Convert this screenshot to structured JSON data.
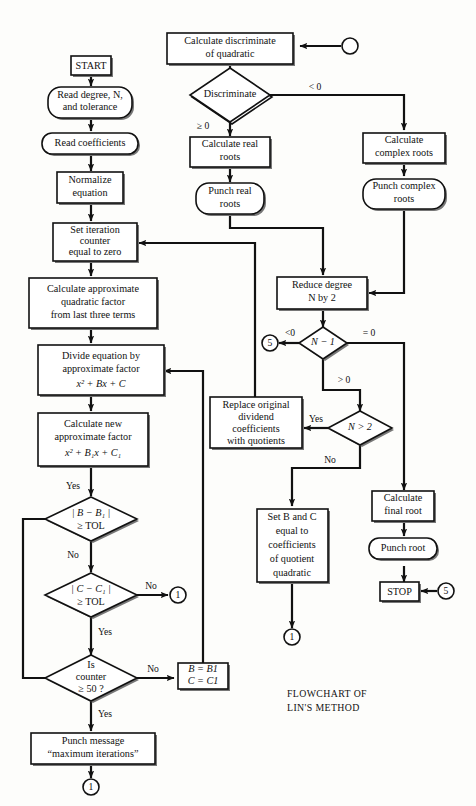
{
  "document": {
    "title": "Flowchart of Lin's Method",
    "caption_line1": "Flowchart of",
    "caption_line2": "Lin's Method",
    "caption_line1_display": "FLOWCHART OF",
    "caption_line2_display": "LIN'S METHOD"
  },
  "colors": {
    "background": "#fdfdfb",
    "stroke": "#111111",
    "fill": "#ffffff",
    "shadow": "#777777"
  },
  "nodes": {
    "start": {
      "label": "START",
      "shape": "terminal-box"
    },
    "read_degree": {
      "line1": "Read degree, N,",
      "line2": "and tolerance",
      "shape": "rounded-io"
    },
    "read_coefficients": {
      "line1": "Read coefficients",
      "shape": "rounded-io"
    },
    "normalize": {
      "line1": "Normalize",
      "line2": "equation",
      "shape": "process"
    },
    "set_iteration": {
      "line1": "Set iteration",
      "line2": "counter",
      "line3": "equal to zero",
      "shape": "process"
    },
    "calc_approx_factor": {
      "line1": "Calculate approximate",
      "line2": "quadratic factor",
      "line3": "from last three terms",
      "shape": "process"
    },
    "divide_equation": {
      "line1": "Divide equation by",
      "line2": "approximate factor",
      "line3": "x² + Bx + C",
      "shape": "process"
    },
    "calc_new_factor": {
      "line1": "Calculate new",
      "line2": "approximate factor",
      "line3": "x² + B₁x + C₁",
      "shape": "process"
    },
    "punch_message": {
      "line1": "Punch message",
      "line2": "“maximum iterations”",
      "shape": "process"
    },
    "set_b_c_box": {
      "line1": "B = B1",
      "line2": "C = C1",
      "shape": "process"
    },
    "calc_discriminate": {
      "line1": "Calculate discriminate",
      "line2": "of quadratic",
      "shape": "process"
    },
    "calc_real_roots": {
      "line1": "Calculate real",
      "line2": "roots",
      "shape": "process"
    },
    "punch_real_roots": {
      "line1": "Punch real",
      "line2": "roots",
      "shape": "rounded-io"
    },
    "calc_complex_roots": {
      "line1": "Calculate",
      "line2": "complex roots",
      "shape": "process"
    },
    "punch_complex_roots": {
      "line1": "Punch complex",
      "line2": "roots",
      "shape": "rounded-io"
    },
    "reduce_degree": {
      "line1": "Reduce degree",
      "line2": "N by 2",
      "shape": "process"
    },
    "replace_dividend": {
      "line1": "Replace original",
      "line2": "dividend",
      "line3": "coefficients",
      "line4": "with quotients",
      "shape": "process"
    },
    "set_b_and_c": {
      "line1": "Set B and C",
      "line2": "equal to",
      "line3": "coefficients",
      "line4": "of quotient",
      "line5": "quadratic",
      "shape": "process"
    },
    "calc_final_root": {
      "line1": "Calculate",
      "line2": "final root",
      "shape": "process"
    },
    "punch_root": {
      "line1": "Punch root",
      "shape": "rounded-io"
    },
    "stop": {
      "label": "STOP",
      "shape": "terminal-box"
    }
  },
  "decisions": {
    "discriminate": {
      "label": "Discriminate",
      "branch_left": "≥ 0",
      "branch_right": "< 0"
    },
    "n_minus_1": {
      "label": "N − 1",
      "branch_left": "<0",
      "branch_right": "= 0",
      "branch_down": "> 0"
    },
    "n_gt_2": {
      "label": "N > 2",
      "branch_left": "Yes",
      "branch_down": "No"
    },
    "b_tol": {
      "line1": "| B − B₁ |",
      "line2": "≥ TOL",
      "branch_in": "Yes",
      "branch_down": "No"
    },
    "c_tol": {
      "line1": "| C − C₁ |",
      "line2": "≥ TOL",
      "branch_right": "No",
      "branch_down": "Yes"
    },
    "counter_50": {
      "line1": "Is",
      "line2": "counter",
      "line3": "≥ 50 ?",
      "branch_right": "No",
      "branch_down": "Yes"
    }
  },
  "connectors": {
    "top_entry": {
      "label": "",
      "name": "connector-entry-blank"
    },
    "one_a": {
      "label": "1"
    },
    "one_b": {
      "label": "1"
    },
    "one_c": {
      "label": "1"
    },
    "five_a": {
      "label": "5"
    },
    "five_b": {
      "label": "5"
    }
  }
}
